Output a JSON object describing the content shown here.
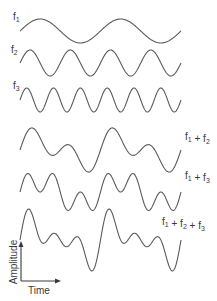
{
  "figure": {
    "type": "waveform superposition",
    "x_start": 20,
    "x_end": 181,
    "stroke_color": "#5a5a5a",
    "text_color": "#3a3a3a",
    "waves": [
      {
        "id": "f1",
        "label_base": "f",
        "label_sub": "1",
        "components": [
          1
        ],
        "center_y": 31,
        "label_x": 13,
        "label_y": 20
      },
      {
        "id": "f2",
        "label_base": "f",
        "label_sub": "2",
        "components": [
          2
        ],
        "center_y": 63,
        "label_x": 11,
        "label_y": 53
      },
      {
        "id": "f3",
        "label_base": "f",
        "label_sub": "3",
        "components": [
          3
        ],
        "center_y": 100,
        "label_x": 13,
        "label_y": 89
      },
      {
        "id": "f1+f2",
        "label": "f1 + f2",
        "components": [
          1,
          2
        ],
        "center_y": 150,
        "label_x": 185,
        "label_y": 140
      },
      {
        "id": "f1+f3",
        "label": "f1 + f3",
        "components": [
          1,
          3
        ],
        "center_y": 192,
        "label_x": 185,
        "label_y": 179
      },
      {
        "id": "f1+f2+f3",
        "label": "f1 + f2 + f3",
        "components": [
          1,
          2,
          3
        ],
        "center_y": 240,
        "label_x": 162,
        "label_y": 225
      }
    ],
    "components": {
      "1": {
        "cycles": 2,
        "amp": 12
      },
      "2": {
        "cycles": 4,
        "amp": 13
      },
      "3": {
        "cycles": 6,
        "amp": 12
      }
    },
    "axes": {
      "y_label": "Amplitude",
      "x_label": "Time"
    }
  }
}
